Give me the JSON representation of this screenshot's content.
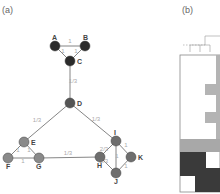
{
  "panels": {
    "a": {
      "label": "(a)"
    },
    "b": {
      "label": "(b)"
    }
  },
  "graph": {
    "nodes": [
      {
        "id": "A",
        "x": 55,
        "y": 46,
        "color": "#2b2b2b",
        "lx": -3,
        "ly": -6
      },
      {
        "id": "B",
        "x": 85,
        "y": 46,
        "color": "#2b2b2b",
        "lx": -2,
        "ly": -6
      },
      {
        "id": "C",
        "x": 70,
        "y": 61,
        "color": "#2b2b2b",
        "lx": 7,
        "ly": 3
      },
      {
        "id": "D",
        "x": 70,
        "y": 103,
        "color": "#555555",
        "lx": 7,
        "ly": 3
      },
      {
        "id": "E",
        "x": 24,
        "y": 142,
        "color": "#8a8a8a",
        "lx": 7,
        "ly": 3
      },
      {
        "id": "F",
        "x": 8,
        "y": 158,
        "color": "#8a8a8a",
        "lx": -2,
        "ly": 11
      },
      {
        "id": "G",
        "x": 39,
        "y": 158,
        "color": "#8a8a8a",
        "lx": -3,
        "ly": 11
      },
      {
        "id": "I",
        "x": 116,
        "y": 141,
        "color": "#6e6e6e",
        "lx": -2,
        "ly": -6
      },
      {
        "id": "H",
        "x": 100,
        "y": 157,
        "color": "#6e6e6e",
        "lx": -3,
        "ly": 11
      },
      {
        "id": "K",
        "x": 131,
        "y": 157,
        "color": "#6e6e6e",
        "lx": 7,
        "ly": 3
      },
      {
        "id": "J",
        "x": 116,
        "y": 173,
        "color": "#6e6e6e",
        "lx": -2,
        "ly": 11
      }
    ],
    "edges": [
      {
        "from": "A",
        "to": "B",
        "weight": "1",
        "lx": 70,
        "ly": 43
      },
      {
        "from": "A",
        "to": "C",
        "weight": "1",
        "lx": 63,
        "ly": 53
      },
      {
        "from": "B",
        "to": "C",
        "weight": "1",
        "lx": 76,
        "ly": 53
      },
      {
        "from": "C",
        "to": "D",
        "weight": "1/3",
        "lx": 73,
        "ly": 83
      },
      {
        "from": "D",
        "to": "E",
        "weight": "1/3",
        "lx": 37,
        "ly": 122
      },
      {
        "from": "D",
        "to": "I",
        "weight": "1/3",
        "lx": 96,
        "ly": 121
      },
      {
        "from": "E",
        "to": "F",
        "weight": "1",
        "lx": 18,
        "ly": 152
      },
      {
        "from": "E",
        "to": "G",
        "weight": "1",
        "lx": 29,
        "ly": 152
      },
      {
        "from": "F",
        "to": "G",
        "weight": "1",
        "lx": 23,
        "ly": 163
      },
      {
        "from": "G",
        "to": "H",
        "weight": "1/3",
        "lx": 68,
        "ly": 155
      },
      {
        "from": "I",
        "to": "H",
        "weight": "2/3",
        "lx": 104,
        "ly": 151
      },
      {
        "from": "H",
        "to": "J",
        "weight": "2/3",
        "lx": 104,
        "ly": 163
      },
      {
        "from": "I",
        "to": "J",
        "weight": "1",
        "lx": 117,
        "ly": 158
      },
      {
        "from": "I",
        "to": "K",
        "weight": "1",
        "lx": 126,
        "ly": 147
      },
      {
        "from": "K",
        "to": "J",
        "weight": "1",
        "lx": 126,
        "ly": 168
      }
    ]
  },
  "matrix": {
    "frame": {
      "x": 180,
      "y": 55,
      "w": 40,
      "h": 137
    },
    "blocks": [
      {
        "x": 205,
        "y": 84,
        "w": 15,
        "h": 11,
        "color": "#b4b4b4"
      },
      {
        "x": 205,
        "y": 112,
        "w": 15,
        "h": 11,
        "color": "#b4b4b4"
      },
      {
        "x": 180,
        "y": 139,
        "w": 40,
        "h": 13,
        "color": "#a8a8a8"
      },
      {
        "x": 180,
        "y": 152,
        "w": 26,
        "h": 24,
        "color": "#3a3a3a"
      },
      {
        "x": 195,
        "y": 168,
        "w": 25,
        "h": 24,
        "color": "#3a3a3a"
      },
      {
        "x": 216,
        "y": 55,
        "w": 4,
        "h": 84,
        "color": "#b4b4b4"
      }
    ],
    "dendrogram": [
      {
        "x1": 183,
        "y1": 45,
        "x2": 205,
        "y2": 45,
        "dashed": true
      },
      {
        "x1": 205,
        "y1": 36,
        "x2": 220,
        "y2": 36,
        "dashed": false
      },
      {
        "x1": 205,
        "y1": 36,
        "x2": 205,
        "y2": 45,
        "dashed": false
      },
      {
        "x1": 190,
        "y1": 45,
        "x2": 210,
        "y2": 45,
        "dashed": false
      },
      {
        "x1": 190,
        "y1": 45,
        "x2": 190,
        "y2": 52,
        "dashed": false
      },
      {
        "x1": 200,
        "y1": 45,
        "x2": 200,
        "y2": 52,
        "dashed": false
      },
      {
        "x1": 210,
        "y1": 45,
        "x2": 210,
        "y2": 52,
        "dashed": false
      }
    ]
  }
}
